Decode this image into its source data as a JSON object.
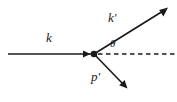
{
  "diagram": {
    "type": "feynman-scattering-diagram",
    "background_color": "#ffffff",
    "stroke_color": "#1a1a1a",
    "labels": {
      "incoming_momentum": "k",
      "outgoing_photon_momentum": "k",
      "outgoing_photon_prime": "'",
      "outgoing_particle_momentum": "p",
      "outgoing_particle_prime": "'",
      "scattering_angle": "θ"
    },
    "vertex": {
      "name": "interaction-vertex",
      "x": 94,
      "y": 54,
      "radius": 3.2
    },
    "lines": [
      {
        "name": "incoming-k-line",
        "style": "solid",
        "arrow": "mid-end",
        "x1": 8,
        "y1": 54,
        "x2": 94,
        "y2": 54
      },
      {
        "name": "outgoing-k-prime-line",
        "style": "solid",
        "arrow": "end",
        "x1": 94,
        "y1": 54,
        "x2": 167,
        "y2": 8
      },
      {
        "name": "outgoing-p-prime-line",
        "style": "solid",
        "arrow": "end",
        "x1": 94,
        "y1": 54,
        "x2": 127,
        "y2": 88
      },
      {
        "name": "axis-reference-dashed-line",
        "style": "dashed",
        "arrow": "none",
        "x1": 97,
        "y1": 54,
        "x2": 175,
        "y2": 54
      }
    ]
  }
}
